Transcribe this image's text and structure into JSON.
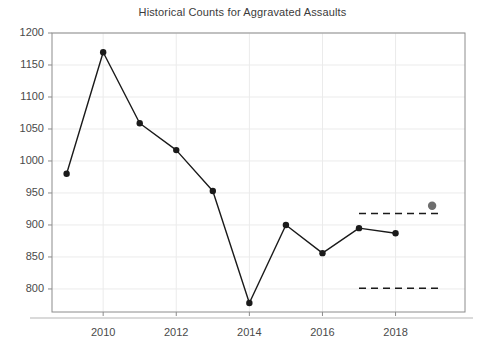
{
  "chart_data": {
    "type": "line",
    "title": "Historical Counts for Aggravated Assaults",
    "xlabel": "",
    "ylabel": "",
    "x": [
      2009,
      2010,
      2011,
      2012,
      2013,
      2014,
      2015,
      2016,
      2017,
      2018
    ],
    "values": [
      980,
      1170,
      1059,
      1017,
      953,
      778,
      900,
      856,
      895,
      887
    ],
    "series": [
      {
        "name": "Historical counts",
        "x": [
          2009,
          2010,
          2011,
          2012,
          2013,
          2014,
          2015,
          2016,
          2017,
          2018
        ],
        "values": [
          980,
          1170,
          1059,
          1017,
          953,
          778,
          900,
          856,
          895,
          887
        ],
        "marker": "filled-circle",
        "color": "#1a1a1a"
      },
      {
        "name": "Highlighted point",
        "x": [
          2019
        ],
        "values": [
          930
        ],
        "marker": "filled-circle",
        "color": "#6e6e6e"
      }
    ],
    "reference_lines": [
      {
        "name": "upper-threshold",
        "y": 918,
        "x_start": 2017,
        "x_end": 2019.2,
        "style": "dashed",
        "color": "#1a1a1a"
      },
      {
        "name": "lower-threshold",
        "y": 801,
        "x_start": 2017,
        "x_end": 2019.2,
        "style": "dashed",
        "color": "#1a1a1a"
      }
    ],
    "ylim": [
      764,
      1200
    ],
    "xlim": [
      2008.6,
      2019.9
    ],
    "yticks": [
      800,
      850,
      900,
      950,
      1000,
      1050,
      1100,
      1150,
      1200
    ],
    "ytick_labels": [
      "800",
      "850",
      "900",
      "950",
      "1000",
      "1050",
      "1100",
      "1150",
      "1200"
    ],
    "xticks": [
      2010,
      2012,
      2014,
      2016,
      2018
    ],
    "xtick_labels": [
      "2010",
      "2012",
      "2014",
      "2016",
      "2018"
    ],
    "grid": true,
    "grid_color": "#ebebeb",
    "axis_color": "#8c8c8c",
    "legend": "none",
    "background": "#ffffff"
  }
}
